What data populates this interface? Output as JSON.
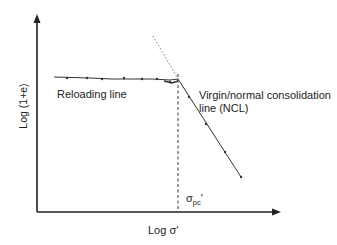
{
  "diagram": {
    "y_axis_label": "Log (1+e)",
    "x_axis_label": "Log σ′",
    "reloading_label": "Reloading line",
    "ncl_label_line1": "Virgin/normal consolidation",
    "ncl_label_line2": "line (NCL)",
    "preconsolidation_symbol": "σ",
    "preconsolidation_subscript": "pc",
    "preconsolidation_prime": "′",
    "colors": {
      "line": "#333333",
      "axis": "#222222",
      "dotted": "#777777"
    }
  }
}
